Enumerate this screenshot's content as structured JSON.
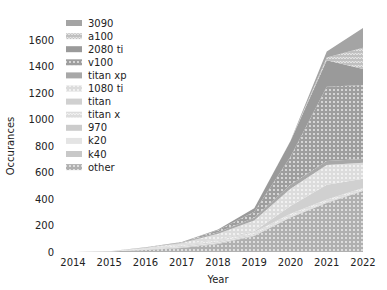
{
  "chart_data": {
    "type": "area",
    "stacked": true,
    "title": "",
    "xlabel": "Year",
    "ylabel": "Occurances",
    "x": [
      2014,
      2015,
      2016,
      2017,
      2018,
      2019,
      2020,
      2021,
      2022
    ],
    "xticks": [
      "2014",
      "2015",
      "2016",
      "2017",
      "2018",
      "2019",
      "2020",
      "2021",
      "2022"
    ],
    "yticks": [
      "0",
      "200",
      "400",
      "600",
      "800",
      "1000",
      "1200",
      "1400",
      "1600"
    ],
    "ylim": [
      0,
      1700
    ],
    "grid": false,
    "legend_position": "upper left",
    "series": [
      {
        "name": "other",
        "color": "#b0b0b0",
        "hatch": "dots",
        "values": [
          0,
          3,
          15,
          30,
          60,
          120,
          260,
          370,
          460
        ]
      },
      {
        "name": "k40",
        "color": "#c8c8c8",
        "hatch": "none",
        "values": [
          0,
          1,
          4,
          6,
          8,
          6,
          4,
          3,
          2
        ]
      },
      {
        "name": "k20",
        "color": "#e4e4e4",
        "hatch": "none",
        "values": [
          0,
          1,
          3,
          4,
          5,
          4,
          3,
          2,
          2
        ]
      },
      {
        "name": "970",
        "color": "#cccccc",
        "hatch": "none",
        "values": [
          0,
          0,
          3,
          5,
          6,
          5,
          5,
          4,
          3
        ]
      },
      {
        "name": "titan x",
        "color": "#dddddd",
        "hatch": "zigzag",
        "values": [
          0,
          0,
          4,
          8,
          12,
          14,
          16,
          18,
          16
        ]
      },
      {
        "name": "titan",
        "color": "#d0d0d0",
        "hatch": "none",
        "values": [
          0,
          0,
          2,
          4,
          6,
          8,
          60,
          110,
          70
        ]
      },
      {
        "name": "1080 ti",
        "color": "#dcdcdc",
        "hatch": "dots",
        "values": [
          0,
          0,
          2,
          10,
          40,
          80,
          130,
          150,
          120
        ]
      },
      {
        "name": "titan xp",
        "color": "#a8a8a8",
        "hatch": "none",
        "values": [
          0,
          0,
          1,
          4,
          12,
          22,
          30,
          30,
          28
        ]
      },
      {
        "name": "v100",
        "color": "#9e9e9e",
        "hatch": "dots",
        "values": [
          0,
          0,
          1,
          4,
          15,
          45,
          210,
          560,
          560
        ]
      },
      {
        "name": "2080 ti",
        "color": "#9a9a9a",
        "hatch": "none",
        "values": [
          0,
          0,
          0,
          0,
          6,
          26,
          120,
          200,
          120
        ]
      },
      {
        "name": "a100",
        "color": "#c0c0c0",
        "hatch": "zigzag",
        "values": [
          0,
          0,
          0,
          0,
          0,
          0,
          2,
          20,
          160
        ]
      },
      {
        "name": "3090",
        "color": "#a4a4a4",
        "hatch": "none",
        "values": [
          0,
          0,
          0,
          0,
          0,
          0,
          0,
          47,
          150
        ]
      }
    ],
    "legend": [
      "3090",
      "a100",
      "2080 ti",
      "v100",
      "titan xp",
      "1080 ti",
      "titan",
      "titan x",
      "970",
      "k20",
      "k40",
      "other"
    ]
  }
}
